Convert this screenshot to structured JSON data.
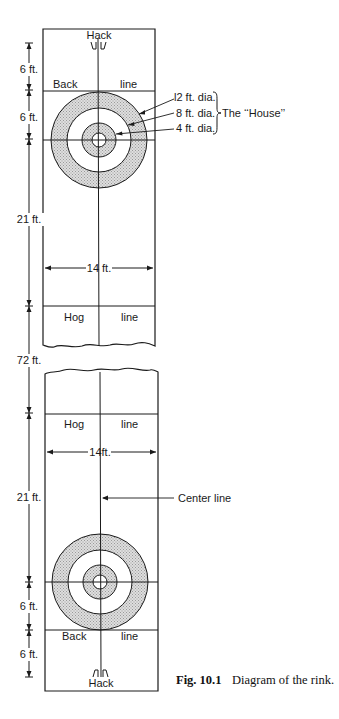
{
  "diagram": {
    "title": "Diagram of the rink",
    "top_end": {
      "hack_label": "Hack",
      "back_line": {
        "left": "Back",
        "right": "line"
      },
      "hog_line": {
        "left": "Hog",
        "right": "line"
      },
      "width_label": "14 ft.",
      "house_labels": {
        "ring_12": "l2 ft. dia.",
        "ring_8": "8 ft. dia.",
        "ring_4": "4 ft. dia.",
        "group": "The ‘‘House’’"
      }
    },
    "bottom_end": {
      "hack_label": "Hack",
      "back_line": {
        "left": "Back",
        "right": "line"
      },
      "hog_line": {
        "left": "Hog",
        "right": "line"
      },
      "width_label": "14ft.",
      "center_line_label": "Center line"
    },
    "dimensions": {
      "top": [
        "6 ft.",
        "6 ft.",
        "21 ft."
      ],
      "middle": "72 ft.",
      "bottom": [
        "21 ft.",
        "6 ft.",
        "6 ft."
      ]
    },
    "colors": {
      "line": "#1a1a1a",
      "shade": "#cfcfcf",
      "background": "#ffffff"
    }
  },
  "caption": {
    "figure_number": "Fig. 10.1",
    "text": "Diagram of the rink."
  }
}
